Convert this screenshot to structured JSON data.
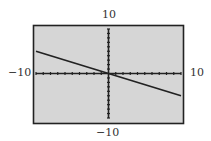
{
  "chart_data": {
    "type": "line",
    "title": "",
    "xlabel": "",
    "ylabel": "",
    "xlim": [
      -10,
      10
    ],
    "ylim": [
      -10,
      10
    ],
    "x_tick_step": 1,
    "y_tick_step": 1,
    "grid": false,
    "window_labels": {
      "xmin": "−10",
      "xmax": "10",
      "ymin": "−10",
      "ymax": "10"
    },
    "series": [
      {
        "name": "y = -0.5x",
        "x": [
          -10,
          10
        ],
        "y": [
          5,
          -5
        ]
      }
    ]
  },
  "colors": {
    "screen": "#d6d6d6",
    "frame": "#222222",
    "axes": "#222222",
    "line": "#222222"
  }
}
